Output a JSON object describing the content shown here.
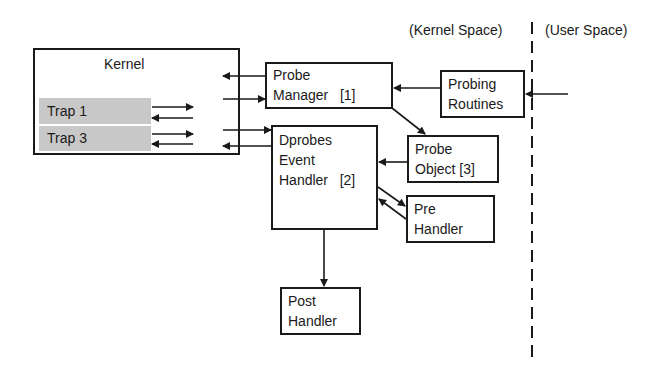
{
  "regions": {
    "kernel_space": "(Kernel Space)",
    "user_space": "(User Space)"
  },
  "kernel": {
    "title": "Kernel",
    "traps": [
      {
        "label": "Trap  1"
      },
      {
        "label": "Trap  3"
      }
    ]
  },
  "nodes": {
    "probe_manager": {
      "line1": "Probe",
      "line2": "Manager   [1]"
    },
    "probing_routines": {
      "line1": "Probing",
      "line2": "Routines"
    },
    "dprobes_handler": {
      "line1": "Dprobes",
      "line2": "Event",
      "line3": "Handler   [2]"
    },
    "probe_object": {
      "line1": "Probe",
      "line2": "Object [3]"
    },
    "pre_handler": {
      "line1": "Pre",
      "line2": "Handler"
    },
    "post_handler": {
      "line1": "Post",
      "line2": "Handler"
    }
  },
  "colors": {
    "line": "#1a1a1a",
    "trap_fill": "#c8c8c8",
    "background": "#ffffff"
  }
}
